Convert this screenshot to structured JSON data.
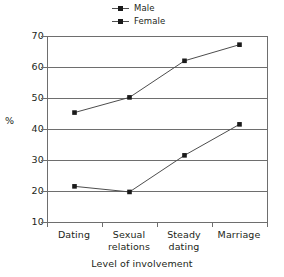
{
  "chart_data": {
    "type": "line",
    "title": "",
    "xlabel": "Level of involvement",
    "ylabel": "%",
    "categories": [
      "Dating",
      "Sexual relations",
      "Steady dating",
      "Marriage"
    ],
    "category_lines": [
      [
        "Dating"
      ],
      [
        "Sexual",
        "relations"
      ],
      [
        "Steady",
        "dating"
      ],
      [
        "Marriage"
      ]
    ],
    "series": [
      {
        "name": "Male",
        "values": [
          21.5,
          19.7,
          31.5,
          41.5
        ],
        "marker": "square",
        "color": "#1a1a1a"
      },
      {
        "name": "Female",
        "values": [
          45.3,
          50.2,
          62.0,
          67.2
        ],
        "marker": "square",
        "color": "#1a1a1a"
      }
    ],
    "ylim": [
      10,
      70
    ],
    "yticks": [
      70,
      60,
      50,
      40,
      30,
      20,
      10
    ],
    "grid": true,
    "legend_position": "top-center"
  },
  "legend": {
    "items": [
      {
        "label": "Male"
      },
      {
        "label": "Female"
      }
    ]
  },
  "axes": {
    "y_title": "%",
    "x_title": "Level of involvement",
    "y_tick_labels": [
      "70",
      "60",
      "50",
      "40",
      "30",
      "20",
      "10"
    ],
    "x_tick_labels": [
      "Dating",
      "Sexual relations",
      "Steady dating",
      "Marriage"
    ]
  },
  "colors": {
    "line": "#4d4d4d",
    "marker": "#1a1a1a",
    "grid": "#6e6e6e",
    "text": "#231f20",
    "background": "#ffffff"
  }
}
